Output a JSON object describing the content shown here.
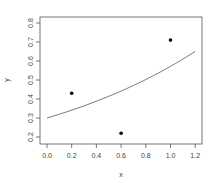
{
  "chart_data": {
    "type": "scatter",
    "title": "",
    "xlabel": "x",
    "ylabel": "y",
    "xlim": [
      -0.05,
      1.25
    ],
    "ylim": [
      0.18,
      0.82
    ],
    "xticks": [
      "0.0",
      "0.2",
      "0.4",
      "0.6",
      "0.8",
      "1.0",
      "1.2"
    ],
    "yticks": [
      "0.2",
      "0.3",
      "0.4",
      "0.5",
      "0.6",
      "0.7",
      "0.8"
    ],
    "grid": false,
    "legend": null,
    "series": [
      {
        "name": "points",
        "kind": "scatter",
        "x": [
          0.2,
          0.6,
          1.0
        ],
        "y": [
          0.43,
          0.22,
          0.71
        ],
        "color": "#000000"
      },
      {
        "name": "fitted curve",
        "kind": "line",
        "formula": "y = 0.3 * exp(0.645 * x)",
        "x": [
          0.0,
          0.2,
          0.4,
          0.6,
          0.8,
          1.0,
          1.2
        ],
        "y": [
          0.3,
          0.34,
          0.39,
          0.44,
          0.5,
          0.57,
          0.65
        ],
        "color": "#555555"
      }
    ]
  }
}
